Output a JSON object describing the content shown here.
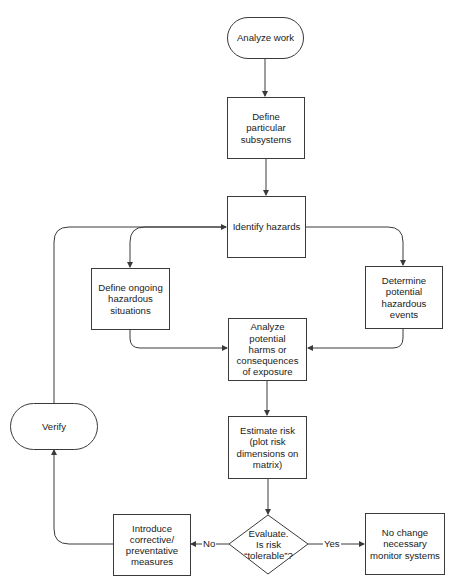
{
  "diagram": {
    "type": "flowchart",
    "colors": {
      "stroke": "#3a3a3a",
      "text": "#222222",
      "background": "#ffffff"
    },
    "nodes": {
      "analyze_work": {
        "shape": "terminal",
        "label": "Analyze work"
      },
      "define_subsystems": {
        "shape": "process",
        "label": "Define particular\nsubsystems"
      },
      "identify_hazards": {
        "shape": "process",
        "label": "Identify hazards"
      },
      "define_ongoing": {
        "shape": "process",
        "label": "Define ongoing\nhazardous\nsituations"
      },
      "determine_events": {
        "shape": "process",
        "label": "Determine\npotential\nhazardous\nevents"
      },
      "analyze_harms": {
        "shape": "process",
        "label": "Analyze potential\nharms or\nconsequences\nof  exposure"
      },
      "estimate_risk": {
        "shape": "process",
        "label": "Estimate risk\n(plot risk\ndimensions on\nmatrix)"
      },
      "evaluate": {
        "shape": "decision",
        "label": "Evaluate.\nIs risk\n“tolerable”?"
      },
      "introduce_measures": {
        "shape": "process",
        "label": "Introduce\ncorrective/\npreventative\nmeasures"
      },
      "no_change": {
        "shape": "process",
        "label": "No change\nnecessary\nmonitor systems"
      },
      "verify": {
        "shape": "terminal",
        "label": "Verify"
      }
    },
    "edge_labels": {
      "no": "No",
      "yes": "Yes"
    },
    "edges": [
      {
        "from": "analyze_work",
        "to": "define_subsystems"
      },
      {
        "from": "define_subsystems",
        "to": "identify_hazards"
      },
      {
        "from": "identify_hazards",
        "to": "define_ongoing"
      },
      {
        "from": "identify_hazards",
        "to": "determine_events"
      },
      {
        "from": "define_ongoing",
        "to": "analyze_harms"
      },
      {
        "from": "determine_events",
        "to": "analyze_harms"
      },
      {
        "from": "analyze_harms",
        "to": "estimate_risk"
      },
      {
        "from": "estimate_risk",
        "to": "evaluate"
      },
      {
        "from": "evaluate",
        "to": "introduce_measures",
        "label": "No"
      },
      {
        "from": "evaluate",
        "to": "no_change",
        "label": "Yes"
      },
      {
        "from": "introduce_measures",
        "to": "verify"
      },
      {
        "from": "verify",
        "to": "identify_hazards"
      }
    ]
  }
}
